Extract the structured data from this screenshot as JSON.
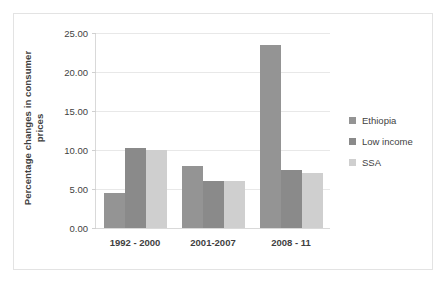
{
  "chart_data": {
    "type": "bar",
    "title": "",
    "xlabel": "",
    "ylabel": "Percentage changes in consumer prices",
    "ylabel_line1": "Percentage changes in consumer",
    "ylabel_line2": "prices",
    "categories": [
      "1992 - 2000",
      "2001-2007",
      "2008 - 11"
    ],
    "series": [
      {
        "name": "Ethiopia",
        "values": [
          4.5,
          8.0,
          23.5
        ],
        "color": "#949494"
      },
      {
        "name": "Low income",
        "values": [
          10.3,
          6.0,
          7.5
        ],
        "color": "#8a8a8a"
      },
      {
        "name": "SSA",
        "values": [
          10.0,
          6.0,
          7.0
        ],
        "color": "#cfcfcf"
      }
    ],
    "ylim": [
      0,
      25
    ],
    "ytick_values": [
      0,
      5,
      10,
      15,
      20,
      25
    ],
    "ytick_labels": [
      "0.00",
      "5.00",
      "10.00",
      "15.00",
      "20.00",
      "25.00"
    ],
    "grid": true,
    "legend_position": "right",
    "background_color": "#ffffff",
    "gridline_color": "#e8e8e8",
    "axis_color": "#d9d9d9",
    "text_color": "#3f3f3f",
    "border_color": "#e3e3e3"
  }
}
